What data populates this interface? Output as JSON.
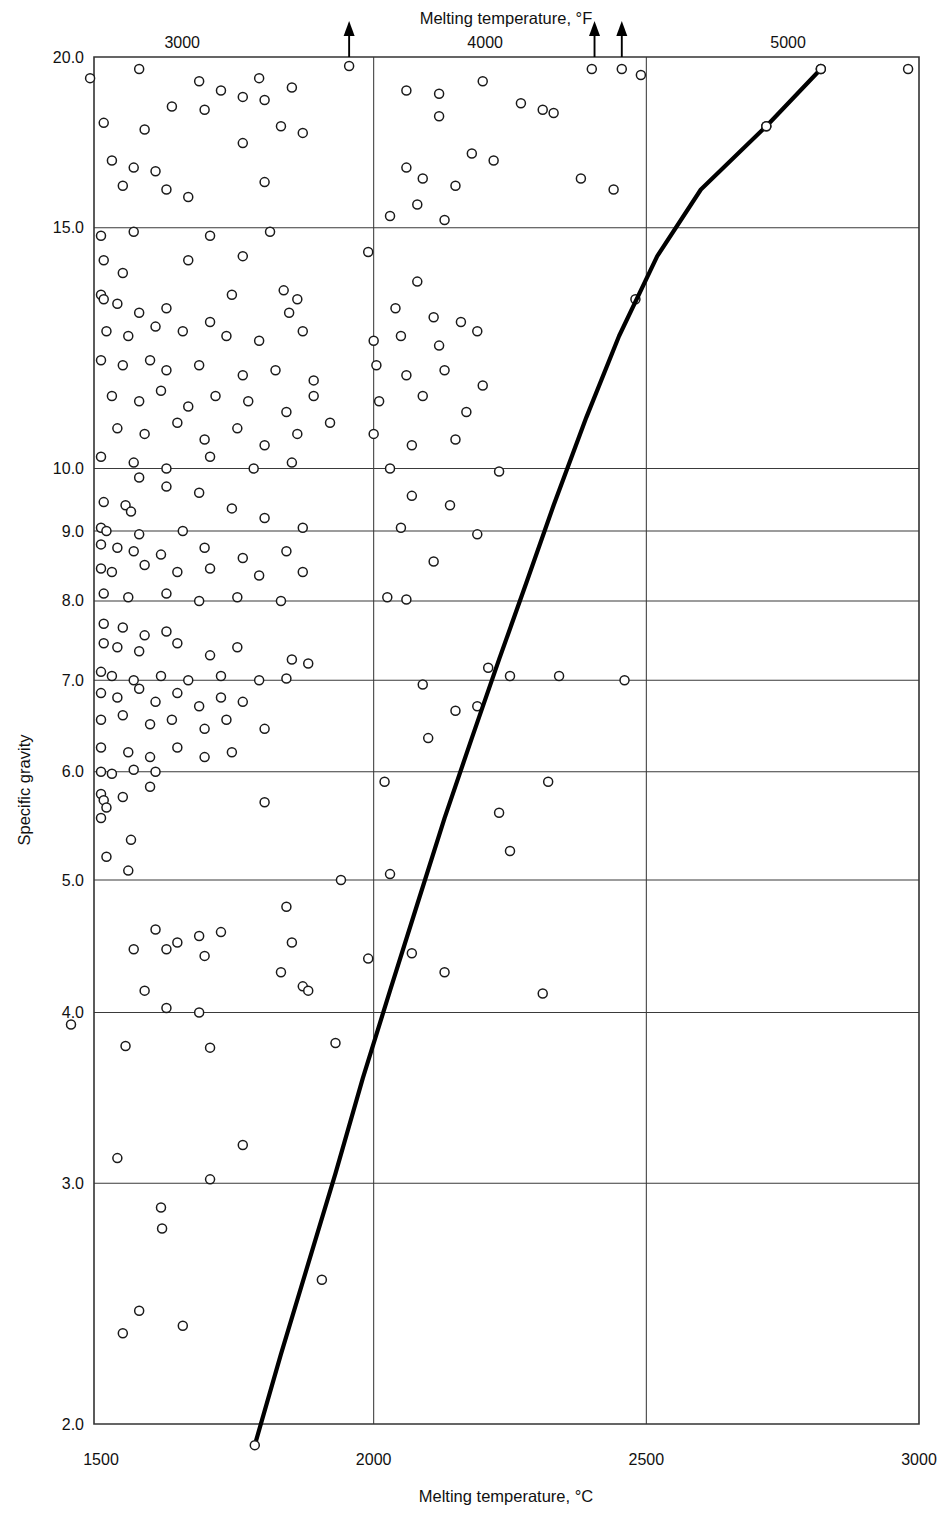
{
  "chart_data": {
    "type": "scatter",
    "title": "",
    "xlabel": "Melting temperature, °C",
    "xlabel_top": "Melting temperature, °F",
    "ylabel": "Specific gravity",
    "xlim": [
      1450,
      3000
    ],
    "ylim": [
      2.0,
      20.0
    ],
    "yscale": "log",
    "xscale": "linear",
    "grid": true,
    "legend": "none",
    "xticks": [
      1500,
      2000,
      2500,
      3000
    ],
    "xticklabels": [
      "1500",
      "2000",
      "2500",
      "3000"
    ],
    "xticks_top": [
      3000,
      4000,
      5000
    ],
    "xticklabels_top": [
      "3000",
      "4000",
      "5000"
    ],
    "yticks": [
      2.0,
      3.0,
      4.0,
      5.0,
      6.0,
      7.0,
      8.0,
      9.0,
      10.0,
      15.0,
      20.0
    ],
    "yticklabels": [
      "2.0",
      "3.0",
      "4.0",
      "5.0",
      "6.0",
      "7.0",
      "8.0",
      "9.0",
      "10.0",
      "15.0",
      "20.0"
    ],
    "gridlines_y": [
      3.0,
      4.0,
      5.0,
      6.0,
      7.0,
      8.0,
      9.0,
      10.0,
      15.0
    ],
    "gridlines_x": [
      2000,
      2500
    ],
    "marker": "open-circle",
    "marker_size": 9,
    "arrow_annotations": [
      {
        "x": 1955,
        "y": 20.0,
        "note": "off-scale-above"
      },
      {
        "x": 2405,
        "y": 20.0,
        "note": "off-scale-above"
      },
      {
        "x": 2455,
        "y": 20.0,
        "note": "off-scale-above"
      }
    ],
    "trend_line": {
      "name": "upper bound envelope",
      "points": [
        [
          1782,
          1.93
        ],
        [
          1830,
          2.25
        ],
        [
          1880,
          2.62
        ],
        [
          1930,
          3.05
        ],
        [
          1980,
          3.58
        ],
        [
          2030,
          4.15
        ],
        [
          2080,
          4.8
        ],
        [
          2130,
          5.55
        ],
        [
          2180,
          6.35
        ],
        [
          2230,
          7.25
        ],
        [
          2280,
          8.25
        ],
        [
          2330,
          9.4
        ],
        [
          2390,
          10.9
        ],
        [
          2450,
          12.5
        ],
        [
          2520,
          14.3
        ],
        [
          2600,
          16.0
        ],
        [
          2720,
          17.8
        ],
        [
          2820,
          19.6
        ]
      ]
    },
    "points": [
      [
        1480,
        19.3
      ],
      [
        1570,
        19.6
      ],
      [
        1680,
        19.2
      ],
      [
        1790,
        19.3
      ],
      [
        1850,
        19.0
      ],
      [
        1720,
        18.9
      ],
      [
        1760,
        18.7
      ],
      [
        1800,
        18.6
      ],
      [
        1630,
        18.4
      ],
      [
        1690,
        18.3
      ],
      [
        1505,
        17.9
      ],
      [
        1580,
        17.7
      ],
      [
        1760,
        17.3
      ],
      [
        1830,
        17.8
      ],
      [
        1870,
        17.6
      ],
      [
        1520,
        16.8
      ],
      [
        1560,
        16.6
      ],
      [
        1600,
        16.5
      ],
      [
        1540,
        16.1
      ],
      [
        1620,
        16.0
      ],
      [
        1660,
        15.8
      ],
      [
        1800,
        16.2
      ],
      [
        1955,
        19.7
      ],
      [
        2060,
        18.9
      ],
      [
        2120,
        18.8
      ],
      [
        2200,
        19.2
      ],
      [
        2270,
        18.5
      ],
      [
        2330,
        18.2
      ],
      [
        2400,
        19.6
      ],
      [
        2455,
        19.6
      ],
      [
        2490,
        19.4
      ],
      [
        2120,
        18.1
      ],
      [
        2310,
        18.3
      ],
      [
        2180,
        17.0
      ],
      [
        2220,
        16.8
      ],
      [
        2060,
        16.6
      ],
      [
        2090,
        16.3
      ],
      [
        2150,
        16.1
      ],
      [
        2380,
        16.3
      ],
      [
        2440,
        16.0
      ],
      [
        2030,
        15.3
      ],
      [
        2080,
        15.6
      ],
      [
        2130,
        15.2
      ],
      [
        1500,
        14.8
      ],
      [
        1560,
        14.9
      ],
      [
        1700,
        14.8
      ],
      [
        1810,
        14.9
      ],
      [
        1505,
        14.2
      ],
      [
        1540,
        13.9
      ],
      [
        1660,
        14.2
      ],
      [
        1760,
        14.3
      ],
      [
        1500,
        13.4
      ],
      [
        1505,
        13.3
      ],
      [
        1530,
        13.2
      ],
      [
        1570,
        13.0
      ],
      [
        1620,
        13.1
      ],
      [
        1740,
        13.4
      ],
      [
        1835,
        13.5
      ],
      [
        1860,
        13.3
      ],
      [
        1845,
        13.0
      ],
      [
        1510,
        12.6
      ],
      [
        1550,
        12.5
      ],
      [
        1600,
        12.7
      ],
      [
        1650,
        12.6
      ],
      [
        1700,
        12.8
      ],
      [
        1730,
        12.5
      ],
      [
        1790,
        12.4
      ],
      [
        1870,
        12.6
      ],
      [
        1500,
        12.0
      ],
      [
        1540,
        11.9
      ],
      [
        1590,
        12.0
      ],
      [
        1620,
        11.8
      ],
      [
        1680,
        11.9
      ],
      [
        1760,
        11.7
      ],
      [
        1820,
        11.8
      ],
      [
        1890,
        11.6
      ],
      [
        1520,
        11.3
      ],
      [
        1570,
        11.2
      ],
      [
        1610,
        11.4
      ],
      [
        1660,
        11.1
      ],
      [
        1710,
        11.3
      ],
      [
        1770,
        11.2
      ],
      [
        1840,
        11.0
      ],
      [
        1890,
        11.3
      ],
      [
        1530,
        10.7
      ],
      [
        1580,
        10.6
      ],
      [
        1640,
        10.8
      ],
      [
        1690,
        10.5
      ],
      [
        1750,
        10.7
      ],
      [
        1800,
        10.4
      ],
      [
        1860,
        10.6
      ],
      [
        1920,
        10.8
      ],
      [
        1500,
        10.2
      ],
      [
        1560,
        10.1
      ],
      [
        1620,
        10.0
      ],
      [
        1700,
        10.2
      ],
      [
        1780,
        10.0
      ],
      [
        1850,
        10.1
      ],
      [
        1990,
        14.4
      ],
      [
        2080,
        13.7
      ],
      [
        2040,
        13.1
      ],
      [
        2110,
        12.9
      ],
      [
        2160,
        12.8
      ],
      [
        2000,
        12.4
      ],
      [
        2050,
        12.5
      ],
      [
        2120,
        12.3
      ],
      [
        2190,
        12.6
      ],
      [
        2005,
        11.9
      ],
      [
        2060,
        11.7
      ],
      [
        2130,
        11.8
      ],
      [
        2200,
        11.5
      ],
      [
        2010,
        11.2
      ],
      [
        2090,
        11.3
      ],
      [
        2170,
        11.0
      ],
      [
        2000,
        10.6
      ],
      [
        2070,
        10.4
      ],
      [
        2150,
        10.5
      ],
      [
        2030,
        10.0
      ],
      [
        2230,
        9.95
      ],
      [
        1570,
        9.85
      ],
      [
        1620,
        9.7
      ],
      [
        1680,
        9.6
      ],
      [
        1505,
        9.45
      ],
      [
        1545,
        9.4
      ],
      [
        1555,
        9.3
      ],
      [
        1740,
        9.35
      ],
      [
        1800,
        9.2
      ],
      [
        1500,
        9.05
      ],
      [
        1510,
        9.0
      ],
      [
        1570,
        8.95
      ],
      [
        1650,
        9.0
      ],
      [
        1870,
        9.05
      ],
      [
        1500,
        8.8
      ],
      [
        1530,
        8.75
      ],
      [
        1560,
        8.7
      ],
      [
        1610,
        8.65
      ],
      [
        1690,
        8.75
      ],
      [
        1760,
        8.6
      ],
      [
        1840,
        8.7
      ],
      [
        1500,
        8.45
      ],
      [
        1520,
        8.4
      ],
      [
        1580,
        8.5
      ],
      [
        1640,
        8.4
      ],
      [
        1700,
        8.45
      ],
      [
        1790,
        8.35
      ],
      [
        1870,
        8.4
      ],
      [
        1505,
        8.1
      ],
      [
        1550,
        8.05
      ],
      [
        1620,
        8.1
      ],
      [
        1680,
        8.0
      ],
      [
        1750,
        8.05
      ],
      [
        1830,
        8.0
      ],
      [
        2070,
        9.55
      ],
      [
        2140,
        9.4
      ],
      [
        2050,
        9.05
      ],
      [
        2190,
        8.95
      ],
      [
        2110,
        8.55
      ],
      [
        2025,
        8.05
      ],
      [
        2060,
        8.02
      ],
      [
        1505,
        7.7
      ],
      [
        1540,
        7.65
      ],
      [
        1580,
        7.55
      ],
      [
        1620,
        7.6
      ],
      [
        1505,
        7.45
      ],
      [
        1530,
        7.4
      ],
      [
        1570,
        7.35
      ],
      [
        1640,
        7.45
      ],
      [
        1700,
        7.3
      ],
      [
        1750,
        7.4
      ],
      [
        1850,
        7.25
      ],
      [
        1880,
        7.2
      ],
      [
        1500,
        7.1
      ],
      [
        1520,
        7.05
      ],
      [
        1560,
        7.0
      ],
      [
        1610,
        7.05
      ],
      [
        1660,
        7.0
      ],
      [
        1720,
        7.05
      ],
      [
        1790,
        7.0
      ],
      [
        1840,
        7.02
      ],
      [
        1500,
        6.85
      ],
      [
        1530,
        6.8
      ],
      [
        1570,
        6.9
      ],
      [
        1600,
        6.75
      ],
      [
        1640,
        6.85
      ],
      [
        1680,
        6.7
      ],
      [
        1720,
        6.8
      ],
      [
        1760,
        6.75
      ],
      [
        1500,
        6.55
      ],
      [
        1540,
        6.6
      ],
      [
        1590,
        6.5
      ],
      [
        1630,
        6.55
      ],
      [
        1690,
        6.45
      ],
      [
        1730,
        6.55
      ],
      [
        1800,
        6.45
      ],
      [
        1500,
        6.25
      ],
      [
        1550,
        6.2
      ],
      [
        1590,
        6.15
      ],
      [
        1640,
        6.25
      ],
      [
        1690,
        6.15
      ],
      [
        1740,
        6.2
      ],
      [
        1500,
        6.0
      ],
      [
        1520,
        5.98
      ],
      [
        1560,
        6.02
      ],
      [
        1600,
        6.0
      ],
      [
        2210,
        7.15
      ],
      [
        2250,
        7.05
      ],
      [
        2340,
        7.05
      ],
      [
        2460,
        7.0
      ],
      [
        2090,
        6.95
      ],
      [
        2190,
        6.7
      ],
      [
        2150,
        6.65
      ],
      [
        2100,
        6.35
      ],
      [
        1500,
        5.78
      ],
      [
        1505,
        5.72
      ],
      [
        1510,
        5.65
      ],
      [
        1540,
        5.75
      ],
      [
        1590,
        5.85
      ],
      [
        1500,
        5.55
      ],
      [
        1555,
        5.35
      ],
      [
        1510,
        5.2
      ],
      [
        1550,
        5.08
      ],
      [
        1800,
        5.7
      ],
      [
        1940,
        5.0
      ],
      [
        2030,
        5.05
      ],
      [
        2020,
        5.9
      ],
      [
        2320,
        5.9
      ],
      [
        2230,
        5.6
      ],
      [
        2250,
        5.25
      ],
      [
        1600,
        4.6
      ],
      [
        1640,
        4.5
      ],
      [
        1620,
        4.45
      ],
      [
        1680,
        4.55
      ],
      [
        1720,
        4.58
      ],
      [
        1690,
        4.4
      ],
      [
        1840,
        4.78
      ],
      [
        1850,
        4.5
      ],
      [
        1830,
        4.28
      ],
      [
        1560,
        4.45
      ],
      [
        1580,
        4.15
      ],
      [
        1870,
        4.18
      ],
      [
        1880,
        4.15
      ],
      [
        1990,
        4.38
      ],
      [
        2070,
        4.42
      ],
      [
        2130,
        4.28
      ],
      [
        2310,
        4.13
      ],
      [
        1445,
        3.92
      ],
      [
        1620,
        4.03
      ],
      [
        1680,
        4.0
      ],
      [
        1545,
        3.78
      ],
      [
        1700,
        3.77
      ],
      [
        1930,
        3.8
      ],
      [
        1530,
        3.13
      ],
      [
        1760,
        3.2
      ],
      [
        1700,
        3.02
      ],
      [
        1610,
        2.88
      ],
      [
        1612,
        2.78
      ],
      [
        1905,
        2.55
      ],
      [
        1570,
        2.42
      ],
      [
        1650,
        2.36
      ],
      [
        1540,
        2.33
      ],
      [
        2720,
        17.8
      ],
      [
        2820,
        19.6
      ],
      [
        2980,
        19.6
      ],
      [
        2480,
        13.3
      ]
    ]
  }
}
